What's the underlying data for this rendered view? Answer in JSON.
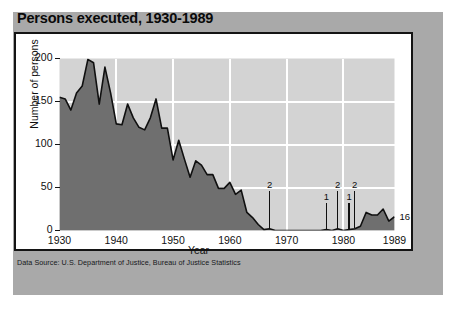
{
  "chart_data": {
    "type": "area",
    "title": "Persons executed, 1930-1989",
    "xlabel": "Year",
    "ylabel": "Number of persons",
    "xlim": [
      1930,
      1989
    ],
    "ylim": [
      0,
      200
    ],
    "grid": true,
    "legend": "none",
    "source": "Data Source: U.S. Department of Justice, Bureau of Justice Statistics",
    "yticks": [
      "0",
      "50",
      "100",
      "150",
      "200"
    ],
    "ytick_values": [
      0,
      50,
      100,
      150,
      200
    ],
    "xticks": [
      "1930",
      "1940",
      "1950",
      "1960",
      "1970",
      "1980",
      "1989"
    ],
    "xtick_values": [
      1930,
      1940,
      1950,
      1960,
      1970,
      1980,
      1989
    ],
    "x": [
      1930,
      1931,
      1932,
      1933,
      1934,
      1935,
      1936,
      1937,
      1938,
      1939,
      1940,
      1941,
      1942,
      1943,
      1944,
      1945,
      1946,
      1947,
      1948,
      1949,
      1950,
      1951,
      1952,
      1953,
      1954,
      1955,
      1956,
      1957,
      1958,
      1959,
      1960,
      1961,
      1962,
      1963,
      1964,
      1965,
      1966,
      1967,
      1968,
      1969,
      1970,
      1971,
      1972,
      1973,
      1974,
      1975,
      1976,
      1977,
      1978,
      1979,
      1980,
      1981,
      1982,
      1983,
      1984,
      1985,
      1986,
      1987,
      1988,
      1989
    ],
    "values": [
      155,
      153,
      140,
      160,
      168,
      199,
      195,
      147,
      190,
      160,
      124,
      123,
      147,
      131,
      120,
      117,
      131,
      153,
      119,
      119,
      82,
      105,
      83,
      62,
      81,
      76,
      65,
      65,
      49,
      49,
      56,
      42,
      47,
      21,
      15,
      7,
      1,
      2,
      0,
      0,
      0,
      0,
      0,
      0,
      0,
      0,
      0,
      1,
      0,
      2,
      0,
      1,
      2,
      5,
      21,
      18,
      18,
      25,
      11,
      16
    ],
    "annotations": [
      {
        "label": "2",
        "year": 1967,
        "value": 2
      },
      {
        "label": "1",
        "year": 1977,
        "value": 1
      },
      {
        "label": "2",
        "year": 1979,
        "value": 2
      },
      {
        "label": "1",
        "year": 1981,
        "value": 1
      },
      {
        "label": "2",
        "year": 1982,
        "value": 2
      },
      {
        "label": "16",
        "year": 1989,
        "value": 16
      }
    ],
    "colors": {
      "area_fill": "#6f6f6f",
      "plot_upper_background": "#d3d3d3",
      "gridline": "#ffffff",
      "line": "#101010",
      "frame": "#141414",
      "card_background": "#a9a9a9",
      "page_background": "#ffffff",
      "text": "#101010"
    }
  }
}
